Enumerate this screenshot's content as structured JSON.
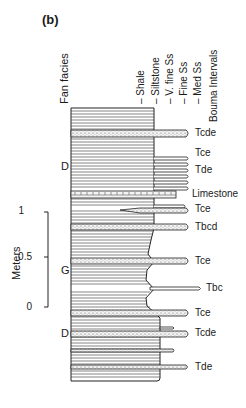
{
  "figure": {
    "panel_label": "(b)",
    "column_headers": {
      "fan_facies": "Fan facies",
      "grain_sizes": [
        "Shale",
        "Siltstone",
        "V. fine Ss",
        "Fine Ss",
        "Med Ss"
      ],
      "bouma": "Bouma Intervals"
    },
    "scale_bar": {
      "title": "Meters",
      "ticks": [
        "1",
        "0.5",
        "0"
      ]
    },
    "facies_labels": [
      {
        "label": "D",
        "position": "upper"
      },
      {
        "label": "G",
        "position": "middle"
      },
      {
        "label": "D",
        "position": "lower"
      }
    ],
    "beds": [
      {
        "label": "Tcde",
        "lithology": "sandstone",
        "grain_size": "Fine Ss"
      },
      {
        "label": "Tce",
        "lithology": "sandstone",
        "grain_size": "V. fine Ss"
      },
      {
        "label": "Tde",
        "lithology": "sandstone",
        "grain_size": "V. fine Ss"
      },
      {
        "label": "Limestone",
        "lithology": "limestone",
        "grain_size": "V. fine Ss"
      },
      {
        "label": "Tce",
        "lithology": "sandstone",
        "grain_size": "Fine Ss"
      },
      {
        "label": "Tbcd",
        "lithology": "sandstone",
        "grain_size": "Fine Ss"
      },
      {
        "label": "Tce",
        "lithology": "sandstone",
        "grain_size": "Fine Ss"
      },
      {
        "label": "Tbc",
        "lithology": "sandstone",
        "grain_size": "Med Ss"
      },
      {
        "label": "Tce",
        "lithology": "sandstone",
        "grain_size": "Fine Ss"
      },
      {
        "label": "Tcde",
        "lithology": "sandstone",
        "grain_size": "Fine Ss"
      },
      {
        "label": "Tde",
        "lithology": "sandstone",
        "grain_size": "Fine Ss"
      }
    ]
  }
}
